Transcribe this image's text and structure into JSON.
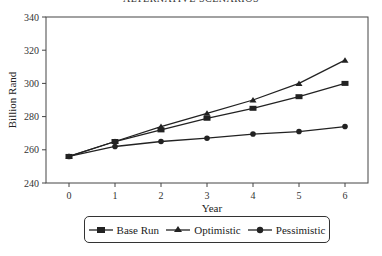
{
  "chart_data": {
    "type": "line",
    "title": "ALTERNATIVE SCENARIOS",
    "xlabel": "Year",
    "ylabel": "Billion Rand",
    "x": [
      0,
      1,
      2,
      3,
      4,
      5,
      6
    ],
    "xlim": [
      -0.5,
      6.5
    ],
    "ylim": [
      240,
      340
    ],
    "yticks": [
      240,
      260,
      280,
      300,
      320,
      340
    ],
    "xticks": [
      0,
      1,
      2,
      3,
      4,
      5,
      6
    ],
    "grid": false,
    "legend_position": "bottom",
    "series": [
      {
        "name": "Base Run",
        "marker": "square",
        "values": [
          256,
          265,
          272,
          279,
          285,
          292,
          300
        ]
      },
      {
        "name": "Optimistic",
        "marker": "triangle",
        "values": [
          256,
          265,
          274,
          282,
          290,
          300,
          314
        ]
      },
      {
        "name": "Pessimistic",
        "marker": "circle",
        "values": [
          256,
          262,
          265,
          267,
          269.5,
          271,
          274
        ]
      }
    ]
  },
  "legend": {
    "base": "Base Run",
    "optimistic": "Optimistic",
    "pessimistic": "Pessimistic"
  }
}
